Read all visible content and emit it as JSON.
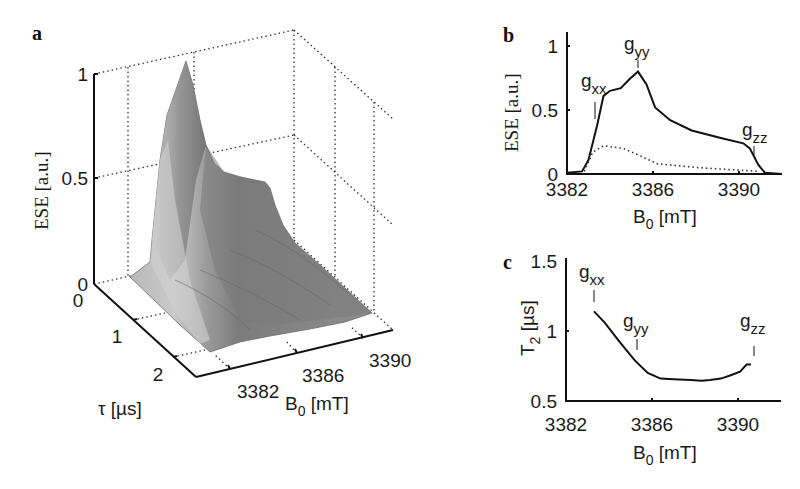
{
  "figure": {
    "panels": [
      {
        "letter": "a"
      },
      {
        "letter": "b"
      },
      {
        "letter": "c"
      }
    ]
  },
  "chart_data": [
    {
      "panel": "a",
      "type": "surface3d",
      "title": "",
      "zlabel": "ESE [a.u.]",
      "ylabel": "τ [µs]",
      "xlabel": "B0 [mT]",
      "z_ticks": [
        "0",
        "0.5",
        "1"
      ],
      "tau_ticks": [
        "0",
        "1",
        "2"
      ],
      "b0_ticks": [
        "3382",
        "3386",
        "3390"
      ],
      "zlim": [
        0,
        1
      ],
      "grid": true,
      "description": "Echo decay surface: ESE amplitude vs field B0 and pulse separation τ; maximum ≈1 near B0≈3385 mT at τ=0, decaying with τ",
      "peak": {
        "B0": 3385.3,
        "tau": 0,
        "ESE": 1.0
      },
      "fill_color": "#8a8a8a"
    },
    {
      "panel": "b",
      "type": "line",
      "title": "",
      "xlabel": "B0 [mT]",
      "ylabel": "ESE [a.u.]",
      "xlim": [
        3382,
        3392
      ],
      "ylim": [
        0,
        1.05
      ],
      "x_ticks": [
        "3382",
        "3386",
        "3390"
      ],
      "y_ticks": [
        "0",
        "0.5",
        "1"
      ],
      "annotations": [
        {
          "text": "g",
          "sub": "xx",
          "x": 3383.4
        },
        {
          "text": "g",
          "sub": "yy",
          "x": 3385.3
        },
        {
          "text": "g",
          "sub": "zz",
          "x": 3390.5
        }
      ],
      "series": [
        {
          "name": "solid",
          "style": "solid",
          "x": [
            3382.0,
            3382.7,
            3383.0,
            3383.4,
            3383.7,
            3384.0,
            3384.5,
            3384.9,
            3385.3,
            3385.7,
            3386.1,
            3386.8,
            3387.8,
            3389.2,
            3390.2,
            3390.5,
            3390.9,
            3391.2,
            3392.0
          ],
          "y": [
            0.01,
            0.02,
            0.11,
            0.38,
            0.61,
            0.65,
            0.67,
            0.74,
            0.8,
            0.7,
            0.52,
            0.42,
            0.34,
            0.28,
            0.24,
            0.2,
            0.07,
            0.01,
            0.0
          ]
        },
        {
          "name": "dotted",
          "style": "dotted",
          "x": [
            3382.8,
            3383.2,
            3383.7,
            3384.6,
            3385.3,
            3386.2,
            3388.1,
            3390.9
          ],
          "y": [
            0.02,
            0.17,
            0.22,
            0.2,
            0.15,
            0.08,
            0.05,
            0.02
          ]
        }
      ]
    },
    {
      "panel": "c",
      "type": "line",
      "title": "",
      "xlabel": "B0 [mT]",
      "ylabel": "T2 [µs]",
      "xlim": [
        3382,
        3392
      ],
      "ylim": [
        0.5,
        1.5
      ],
      "x_ticks": [
        "3382",
        "3386",
        "3390"
      ],
      "y_ticks": [
        "0.5",
        "1",
        "1.5"
      ],
      "annotations": [
        {
          "text": "g",
          "sub": "xx",
          "x": 3383.3
        },
        {
          "text": "g",
          "sub": "yy",
          "x": 3385.3
        },
        {
          "text": "g",
          "sub": "zz",
          "x": 3390.6
        }
      ],
      "series": [
        {
          "name": "T2",
          "style": "solid",
          "x": [
            3383.3,
            3383.8,
            3384.5,
            3385.2,
            3385.8,
            3386.4,
            3387.0,
            3387.8,
            3388.3,
            3388.7,
            3389.2,
            3389.6,
            3390.1,
            3390.4,
            3390.6
          ],
          "y": [
            1.14,
            1.06,
            0.92,
            0.79,
            0.7,
            0.66,
            0.655,
            0.65,
            0.645,
            0.65,
            0.66,
            0.68,
            0.71,
            0.76,
            0.76
          ]
        }
      ]
    }
  ],
  "labels": {
    "a": {
      "letter": "a",
      "z1": "1",
      "z05": "0.5",
      "z0": "0",
      "t0": "0",
      "t1": "1",
      "t2": "2",
      "b1": "3382",
      "b2": "3386",
      "b3": "3390",
      "zlabel": "ESE [a.u.]",
      "tau_label": "τ [µs]",
      "b0_main": "B",
      "b0_sub": "0",
      "b0_unit": " [mT]"
    },
    "b": {
      "letter": "b",
      "y1": "1",
      "y05": "0.5",
      "y0": "0",
      "x1": "3382",
      "x2": "3386",
      "x3": "3390",
      "ylabel": "ESE [a.u.]",
      "x_main": "B",
      "x_sub": "0",
      "x_unit": " [mT]",
      "gxx": "g",
      "gxx_sub": "xx",
      "gyy": "g",
      "gyy_sub": "yy",
      "gzz": "g",
      "gzz_sub": "zz"
    },
    "c": {
      "letter": "c",
      "y15": "1.5",
      "y1": "1",
      "y05": "0.5",
      "x1": "3382",
      "x2": "3386",
      "x3": "3390",
      "ylabel_main": "T",
      "ylabel_sub": "2",
      "ylabel_unit": " [µs]",
      "x_main": "B",
      "x_sub": "0",
      "x_unit": " [mT]",
      "gxx": "g",
      "gxx_sub": "xx",
      "gyy": "g",
      "gyy_sub": "yy",
      "gzz": "g",
      "gzz_sub": "zz"
    }
  }
}
